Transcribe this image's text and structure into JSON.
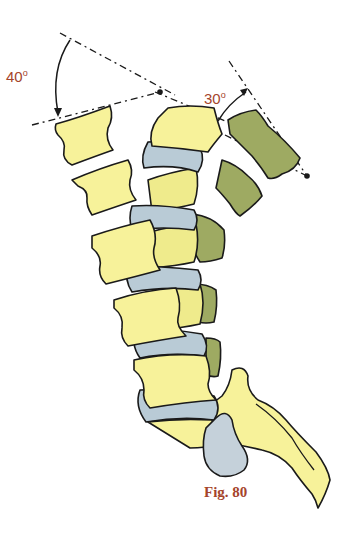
{
  "figure": {
    "caption": "Fig. 80",
    "angles": [
      {
        "id": "left-angle",
        "value": "40",
        "unit": "o"
      },
      {
        "id": "right-angle",
        "value": "30",
        "unit": "o"
      }
    ],
    "colors": {
      "vertebra_yellow": "#f7f29a",
      "vertebra_green": "#9eaa62",
      "disc_blue": "#b9cbd6",
      "outline": "#1a1a1a",
      "label_red": "#a5442c"
    }
  }
}
